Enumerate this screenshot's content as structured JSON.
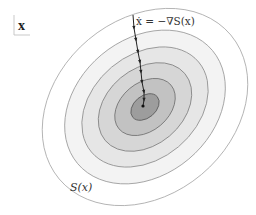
{
  "diagram": {
    "variable_label": "x",
    "flow_equation": "ẋ = −∇S(x)",
    "surface_label": "S(x)",
    "center": [
      145,
      107
    ],
    "rotation_deg": -40,
    "contours": [
      {
        "rx": 112,
        "ry": 88,
        "fill": "#ffffff",
        "stroke": "#a8a8a8"
      },
      {
        "rx": 88,
        "ry": 68,
        "fill": "#f3f3f3",
        "stroke": "#9a9a9a"
      },
      {
        "rx": 70,
        "ry": 52,
        "fill": "#e6e6e6",
        "stroke": "#8e8e8e"
      },
      {
        "rx": 52,
        "ry": 38,
        "fill": "#d6d6d6",
        "stroke": "#808080"
      },
      {
        "rx": 34,
        "ry": 24,
        "fill": "#c2c2c2",
        "stroke": "#707070"
      },
      {
        "rx": 16,
        "ry": 11,
        "fill": "#9d9d9d",
        "stroke": "#5a5a5a"
      }
    ],
    "path_points": [
      [
        133,
        15
      ],
      [
        134,
        28
      ],
      [
        136,
        40
      ],
      [
        138,
        52
      ],
      [
        140,
        62
      ],
      [
        141,
        72
      ],
      [
        142,
        82
      ],
      [
        144,
        92
      ],
      [
        144,
        100
      ],
      [
        143,
        106
      ]
    ],
    "colors": {
      "path": "#222222",
      "label": "#333333"
    }
  }
}
